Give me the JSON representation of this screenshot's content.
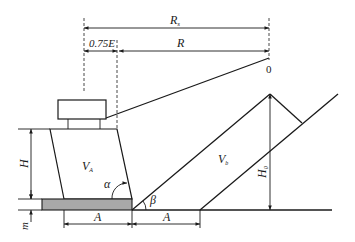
{
  "diagram": {
    "type": "engineering-dimension-diagram",
    "colors": {
      "line": "#1a1a1a",
      "fill_base": "#a8a8a8",
      "background": "#ffffff"
    },
    "labels": {
      "Rs": {
        "main": "R",
        "sub": "s"
      },
      "R": "R",
      "offset": "0.75E",
      "origin": "0",
      "E": "E",
      "H": "H",
      "VA": {
        "main": "V",
        "sub": "A"
      },
      "Vb": {
        "main": "V",
        "sub": "b"
      },
      "H0": {
        "main": "H",
        "sub": "0"
      },
      "alpha": "α",
      "beta": "β",
      "m": "m",
      "A_left": "A",
      "A_right": "A"
    }
  }
}
